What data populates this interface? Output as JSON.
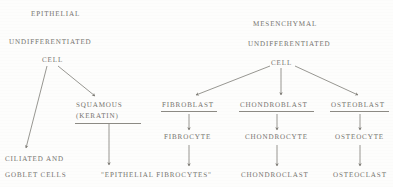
{
  "diagram": {
    "title_left": "EPITHELIAL",
    "title_right": "MESENCHYMAL",
    "subtitle_left": "UNDIFFERENTIATED",
    "subtitle_right": "UNDIFFERENTIATED",
    "root_left": "CELL",
    "root_right": "CELL",
    "left_branch": {
      "terminal_line1": "CILIATED AND",
      "terminal_line2": "GOBLET CELLS",
      "squamous_line1": "SQUAMOUS",
      "squamous_line2": "(KERATIN)",
      "squamous_terminal": "\"EPITHELIAL FIBROCYTES\""
    },
    "right_branches": [
      {
        "blast": "FIBROBLAST",
        "cyte": "FIBROCYTE",
        "clast": ""
      },
      {
        "blast": "CHONDROBLAST",
        "cyte": "CHONDROCYTE",
        "clast": "CHONDROCLAST"
      },
      {
        "blast": "OSTEOBLAST",
        "cyte": "OSTEOCYTE",
        "clast": "OSTEOCLAST"
      }
    ],
    "colors": {
      "ink": "#74726d",
      "line": "#8a8882",
      "page": "#fdfdfc"
    }
  }
}
